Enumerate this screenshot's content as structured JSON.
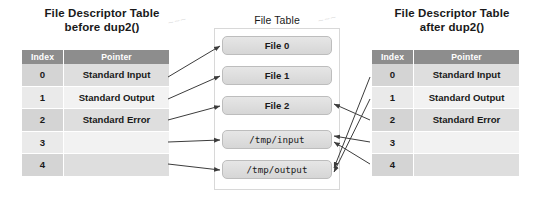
{
  "panels": {
    "left": {
      "title_line1": "File Descriptor Table",
      "title_line2": "before dup2()",
      "headers": {
        "index": "Index",
        "pointer": "Pointer"
      },
      "rows": [
        {
          "index": "0",
          "pointer": "Standard Input"
        },
        {
          "index": "1",
          "pointer": "Standard Output"
        },
        {
          "index": "2",
          "pointer": "Standard Error"
        },
        {
          "index": "3",
          "pointer": ""
        },
        {
          "index": "4",
          "pointer": ""
        }
      ]
    },
    "middle": {
      "title": "File Table",
      "files": [
        {
          "label": "File 0",
          "mono": false
        },
        {
          "label": "File 1",
          "mono": false
        },
        {
          "label": "File 2",
          "mono": false
        },
        {
          "label": "/tmp/input",
          "mono": true
        },
        {
          "label": "/tmp/output",
          "mono": true
        }
      ]
    },
    "right": {
      "title_line1": "File Descriptor Table",
      "title_line2": "after dup2()",
      "headers": {
        "index": "Index",
        "pointer": "Pointer"
      },
      "rows": [
        {
          "index": "0",
          "pointer": "Standard Input"
        },
        {
          "index": "1",
          "pointer": "Standard Output"
        },
        {
          "index": "2",
          "pointer": "Standard Error"
        },
        {
          "index": "3",
          "pointer": ""
        },
        {
          "index": "4",
          "pointer": ""
        }
      ]
    }
  },
  "watermarks": {
    "one": "~~~",
    "two": "~~~"
  },
  "colors": {
    "header_gray": "#8d8d8d",
    "row_dark_index": "#d4d4d4",
    "row_dark_pointer": "#dedede",
    "row_light_index": "#eaeaea",
    "row_light_pointer": "#f2f2f2",
    "file_box_border": "#bdbdbd",
    "connector": "#3c3c3c",
    "background": "#ffffff"
  },
  "connections": {
    "before": [
      {
        "from_index": "0",
        "to_file": "File 0"
      },
      {
        "from_index": "1",
        "to_file": "File 1"
      },
      {
        "from_index": "2",
        "to_file": "File 2"
      },
      {
        "from_index": "3",
        "to_file": "/tmp/input"
      },
      {
        "from_index": "4",
        "to_file": "/tmp/output"
      }
    ],
    "after": [
      {
        "from_index": "0",
        "to_file": "/tmp/output"
      },
      {
        "from_index": "1",
        "to_file": "/tmp/output"
      },
      {
        "from_index": "2",
        "to_file": "File 2"
      },
      {
        "from_index": "3",
        "to_file": "/tmp/input"
      },
      {
        "from_index": "4",
        "to_file": "/tmp/input"
      }
    ]
  }
}
